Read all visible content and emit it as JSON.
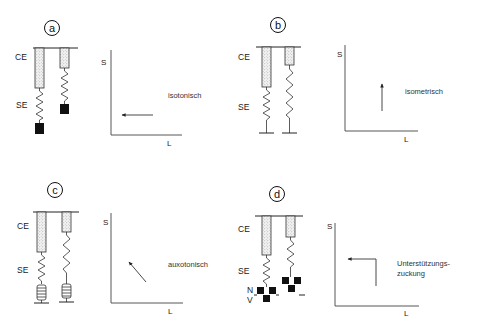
{
  "panels": [
    {
      "id": "a",
      "letter": "a",
      "model_labels": {
        "ce": "CE",
        "se": "SE"
      },
      "graph": {
        "y_axis": "S",
        "x_axis": "L",
        "mode": "isotonisch",
        "arrow_direction": "left"
      }
    },
    {
      "id": "b",
      "letter": "b",
      "model_labels": {
        "ce": "CE",
        "se": "SE"
      },
      "graph": {
        "y_axis": "S",
        "x_axis": "L",
        "mode": "isometrisch",
        "arrow_direction": "up"
      }
    },
    {
      "id": "c",
      "letter": "c",
      "model_labels": {
        "ce": "CE",
        "se": "SE"
      },
      "graph": {
        "y_axis": "S",
        "x_axis": "L",
        "mode": "auxotonisch",
        "arrow_direction": "up-left"
      }
    },
    {
      "id": "d",
      "letter": "d",
      "model_labels": {
        "ce": "CE",
        "se": "SE",
        "n": "N",
        "v": "V"
      },
      "graph": {
        "y_axis": "S",
        "x_axis": "L",
        "mode_line1": "Unterstützungs-",
        "mode_line2": "zuckung",
        "arrow_direction": "up-then-left"
      }
    }
  ]
}
